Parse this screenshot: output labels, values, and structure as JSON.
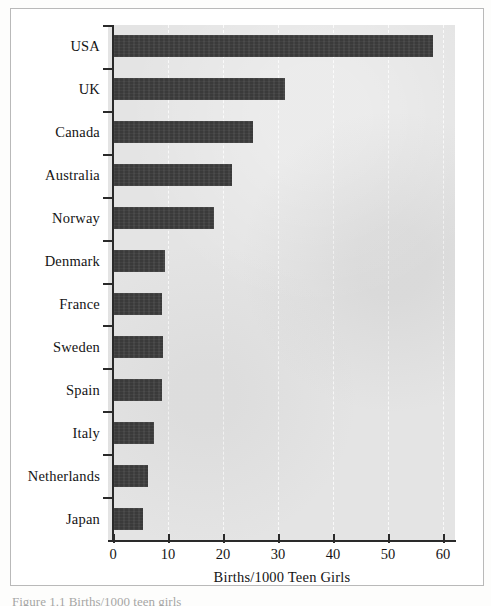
{
  "figure": {
    "caption_fragment": "Figure 1.1   Births/1000 teen girls",
    "frame_color": "#b9b9b9"
  },
  "chart_data": {
    "type": "bar",
    "orientation": "horizontal",
    "title": "",
    "subtitle": "",
    "xlabel": "Births/1000 Teen Girls",
    "ylabel": "",
    "categories": [
      "USA",
      "UK",
      "Canada",
      "Australia",
      "Norway",
      "Denmark",
      "France",
      "Sweden",
      "Spain",
      "Italy",
      "Netherlands",
      "Japan"
    ],
    "values": [
      58.2,
      31.3,
      25.5,
      21.6,
      18.4,
      9.5,
      8.9,
      9.1,
      8.9,
      7.5,
      6.4,
      5.5
    ],
    "xlim": [
      0,
      63
    ],
    "xticks": [
      0,
      10,
      20,
      30,
      40,
      50,
      60
    ],
    "xticklabels": [
      "0",
      "10",
      "20",
      "30",
      "40",
      "50",
      "60"
    ],
    "grid": "vertical-dashed-white",
    "legend": "none",
    "bar_color": "#3a3a3a",
    "plot_background": "#e4e4e4"
  }
}
